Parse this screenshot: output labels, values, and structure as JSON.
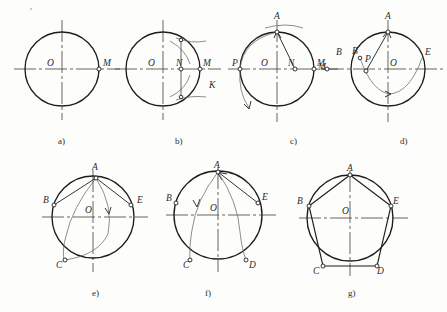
{
  "figure": {
    "background_color": "#fdfdfc",
    "ink_color": "#1d1d1d",
    "construction_color": "#6a6a6a",
    "step_count": 7
  },
  "steps": [
    {
      "id": "a",
      "caption": "a)",
      "caption_x": 58,
      "caption_y": 144,
      "center": {
        "x": 62,
        "y": 69
      },
      "radius": 37,
      "point_labels": [
        {
          "name": "O",
          "text": "O",
          "x": 47,
          "y": 66,
          "marker": false,
          "mx": 62,
          "my": 69
        },
        {
          "name": "M",
          "text": "M",
          "x": 103,
          "y": 66,
          "marker": true,
          "mx": 99,
          "my": 69
        }
      ]
    },
    {
      "id": "b",
      "caption": "b)",
      "caption_x": 175,
      "caption_y": 144,
      "center": {
        "x": 163,
        "y": 69
      },
      "radius": 37,
      "point_labels": [
        {
          "name": "O",
          "text": "O",
          "x": 148,
          "y": 66,
          "marker": false,
          "mx": 163,
          "my": 69
        },
        {
          "name": "N",
          "text": "N",
          "x": 176,
          "y": 66,
          "marker": true,
          "mx": 181,
          "my": 69
        },
        {
          "name": "M",
          "text": "M",
          "x": 203,
          "y": 66,
          "marker": true,
          "mx": 200,
          "my": 69
        },
        {
          "name": "K",
          "text": "K",
          "x": 209,
          "y": 88,
          "marker": false,
          "mx": 212,
          "my": 84
        }
      ]
    },
    {
      "id": "c",
      "caption": "c)",
      "caption_x": 290,
      "caption_y": 144,
      "center": {
        "x": 277,
        "y": 69
      },
      "radius": 37,
      "point_labels": [
        {
          "name": "A",
          "text": "A",
          "x": 274,
          "y": 19,
          "marker": true,
          "mx": 277,
          "my": 32
        },
        {
          "name": "P",
          "text": "P",
          "x": 232,
          "y": 66,
          "marker": true,
          "mx": 240,
          "my": 69
        },
        {
          "name": "O",
          "text": "O",
          "x": 261,
          "y": 66,
          "marker": false,
          "mx": 277,
          "my": 69
        },
        {
          "name": "N",
          "text": "N",
          "x": 288,
          "y": 66,
          "marker": true,
          "mx": 295,
          "my": 69
        },
        {
          "name": "M",
          "text": "M",
          "x": 317,
          "y": 66,
          "marker": true,
          "mx": 314,
          "my": 69
        },
        {
          "name": "B",
          "text": "B",
          "x": 336,
          "y": 55,
          "marker": false,
          "mx": 336,
          "my": 55
        }
      ]
    },
    {
      "id": "d",
      "caption": "d)",
      "caption_x": 400,
      "caption_y": 144,
      "center": {
        "x": 388,
        "y": 69
      },
      "radius": 37,
      "point_labels": [
        {
          "name": "A",
          "text": "A",
          "x": 385,
          "y": 19,
          "marker": true,
          "mx": 388,
          "my": 32
        },
        {
          "name": "B",
          "text": "B",
          "x": 352,
          "y": 54,
          "marker": true,
          "mx": 360,
          "my": 58
        },
        {
          "name": "P",
          "text": "P",
          "x": 365,
          "y": 62,
          "marker": true,
          "mx": 366,
          "my": 71
        },
        {
          "name": "O",
          "text": "O",
          "x": 390,
          "y": 66,
          "marker": false,
          "mx": 388,
          "my": 69
        },
        {
          "name": "E",
          "text": "E",
          "x": 425,
          "y": 55,
          "marker": false,
          "mx": 422,
          "my": 58
        },
        {
          "name": "M",
          "text": "M",
          "x": 318,
          "y": 70,
          "marker": true,
          "mx": 327,
          "my": 69
        }
      ]
    },
    {
      "id": "e",
      "caption": "e)",
      "caption_x": 92,
      "caption_y": 296,
      "center": {
        "x": 93,
        "y": 217
      },
      "radius": 41,
      "point_labels": [
        {
          "name": "A",
          "text": "A",
          "x": 92,
          "y": 170,
          "marker": true,
          "mx": 96,
          "my": 178
        },
        {
          "name": "B",
          "text": "B",
          "x": 43,
          "y": 203,
          "marker": true,
          "mx": 54,
          "my": 205
        },
        {
          "name": "O",
          "text": "O",
          "x": 85,
          "y": 213,
          "marker": false,
          "mx": 93,
          "my": 217
        },
        {
          "name": "E",
          "text": "E",
          "x": 137,
          "y": 203,
          "marker": true,
          "mx": 131,
          "my": 205
        },
        {
          "name": "C",
          "text": "C",
          "x": 56,
          "y": 268,
          "marker": true,
          "mx": 65,
          "my": 260
        }
      ]
    },
    {
      "id": "f",
      "caption": "f)",
      "caption_x": 205,
      "caption_y": 296,
      "center": {
        "x": 218,
        "y": 215
      },
      "radius": 44,
      "point_labels": [
        {
          "name": "A",
          "text": "A",
          "x": 214,
          "y": 168,
          "marker": true,
          "mx": 218,
          "my": 172
        },
        {
          "name": "B",
          "text": "B",
          "x": 166,
          "y": 201,
          "marker": true,
          "mx": 176,
          "my": 203
        },
        {
          "name": "O",
          "text": "O",
          "x": 210,
          "y": 211,
          "marker": false,
          "mx": 218,
          "my": 215
        },
        {
          "name": "E",
          "text": "E",
          "x": 262,
          "y": 200,
          "marker": true,
          "mx": 258,
          "my": 203
        },
        {
          "name": "C",
          "text": "C",
          "x": 183,
          "y": 268,
          "marker": true,
          "mx": 190,
          "my": 260
        },
        {
          "name": "D",
          "text": "D",
          "x": 249,
          "y": 268,
          "marker": true,
          "mx": 246,
          "my": 260
        }
      ]
    },
    {
      "id": "g",
      "caption": "g)",
      "caption_x": 348,
      "caption_y": 296,
      "center": {
        "x": 350,
        "y": 218
      },
      "radius": 43,
      "point_labels": [
        {
          "name": "A",
          "text": "A",
          "x": 347,
          "y": 171,
          "marker": true,
          "mx": 350,
          "my": 175
        },
        {
          "name": "B",
          "text": "B",
          "x": 297,
          "y": 204,
          "marker": true,
          "mx": 309,
          "my": 206
        },
        {
          "name": "O",
          "text": "O",
          "x": 342,
          "y": 214,
          "marker": false,
          "mx": 350,
          "my": 218
        },
        {
          "name": "E",
          "text": "E",
          "x": 393,
          "y": 204,
          "marker": true,
          "mx": 391,
          "my": 206
        },
        {
          "name": "C",
          "text": "C",
          "x": 313,
          "y": 274,
          "marker": true,
          "mx": 323,
          "my": 266
        },
        {
          "name": "D",
          "text": "D",
          "x": 377,
          "y": 274,
          "marker": true,
          "mx": 377,
          "my": 266
        }
      ]
    }
  ]
}
